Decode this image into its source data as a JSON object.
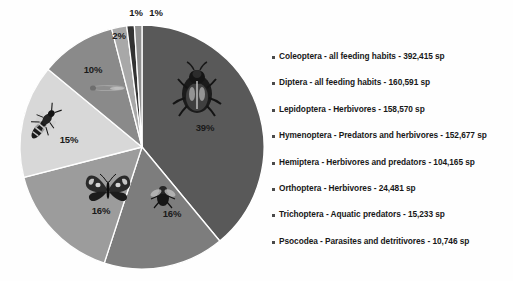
{
  "chart_data": {
    "type": "pie",
    "title": "",
    "subtitle": "",
    "xlabel": "",
    "ylabel": "",
    "grid": false,
    "legend_position": "right",
    "total_species": 1018878,
    "unit": "sp",
    "categories": [
      "Coleoptera - all feeding habits",
      "Diptera - all feeding habits",
      "Lepidoptera - Herbivores",
      "Hymenoptera - Predators and herbivores",
      "Hemiptera - Herbivores and predators",
      "Orthoptera - Herbivores",
      "Trichoptera - Aquatic predators",
      "Psocodea - Parasites and detritivores"
    ],
    "values": [
      392415,
      160591,
      158570,
      152677,
      104165,
      24481,
      15233,
      10746
    ],
    "percent_labels": [
      "39%",
      "16%",
      "16%",
      "15%",
      "10%",
      "2%",
      "1%",
      "1%"
    ],
    "percents": [
      39,
      16,
      16,
      15,
      10,
      2,
      1,
      1
    ],
    "slice_colors": [
      "#595959",
      "#7d7d7d",
      "#9c9c9c",
      "#d8d8d8",
      "#8a8a8a",
      "#a8a8a8",
      "#333333",
      "#909090"
    ],
    "slice_label_positions": [
      {
        "label": "39%",
        "x": 205,
        "y": 128
      },
      {
        "label": "16%",
        "x": 172,
        "y": 214
      },
      {
        "label": "16%",
        "x": 101,
        "y": 211
      },
      {
        "label": "15%",
        "x": 69,
        "y": 140
      },
      {
        "label": "10%",
        "x": 93,
        "y": 70
      },
      {
        "label": "2%",
        "x": 119,
        "y": 36
      },
      {
        "label": "1%",
        "x": 136,
        "y": 13
      },
      {
        "label": "1%",
        "x": 156,
        "y": 13
      }
    ],
    "pie_geometry": {
      "cx": 142,
      "cy": 147,
      "r": 122,
      "start_angle_deg": -90,
      "direction": "clockwise"
    }
  },
  "legend": {
    "bullet_icon": "square-bullet-icon",
    "items": [
      {
        "order": "taxon-coleoptera",
        "text": "Coleoptera - all feeding habits - 392,415 sp"
      },
      {
        "order": "taxon-diptera",
        "text": "Diptera - all feeding habits - 160,591 sp"
      },
      {
        "order": "taxon-lepidoptera",
        "text": "Lepidoptera - Herbivores - 158,570 sp"
      },
      {
        "order": "taxon-hymenoptera",
        "text": "Hymenoptera - Predators and herbivores - 152,677 sp"
      },
      {
        "order": "taxon-hemiptera",
        "text": "Hemiptera - Herbivores and predators - 104,165 sp"
      },
      {
        "order": "taxon-orthoptera",
        "text": "Orthoptera - Herbivores - 24,481 sp"
      },
      {
        "order": "taxon-trichoptera",
        "text": "Trichoptera - Aquatic predators - 15,233 sp"
      },
      {
        "order": "taxon-psocodea",
        "text": "Psocodea - Parasites and detritivores - 10,746 sp"
      }
    ]
  },
  "insect_images": [
    {
      "name": "beetle-photo",
      "x": 197,
      "y": 90,
      "w": 46,
      "h": 46
    },
    {
      "name": "fly-photo",
      "x": 163,
      "y": 196,
      "w": 24,
      "h": 22
    },
    {
      "name": "butterfly-photo",
      "x": 108,
      "y": 190,
      "w": 44,
      "h": 30
    },
    {
      "name": "wasp-photo",
      "x": 44,
      "y": 123,
      "w": 34,
      "h": 34
    },
    {
      "name": "dragonfly-photo",
      "x": 108,
      "y": 88,
      "w": 36,
      "h": 10
    }
  ],
  "colors": {
    "background": "#fefefe",
    "text": "#181818",
    "slice_separator": "#ffffff",
    "bullet": "#4a4a4a"
  }
}
